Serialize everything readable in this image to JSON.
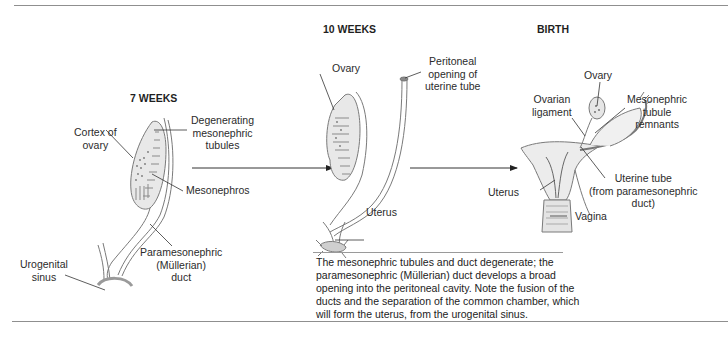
{
  "stages": [
    {
      "id": "7-weeks",
      "title": "7 WEEKS"
    },
    {
      "id": "10-weeks",
      "title": "10 WEEKS"
    },
    {
      "id": "birth",
      "title": "BIRTH"
    }
  ],
  "labels": {
    "week7": {
      "cortex_of_ovary": "Cortex of\novary",
      "degenerating_tubules": "Degenerating\nmesonephric\ntubules",
      "mesonephros": "Mesonephros",
      "paramesonephric_duct": "Paramesonephric\n(Müllerian)\nduct",
      "urogenital_sinus": "Urogenital\nsinus"
    },
    "week10": {
      "ovary": "Ovary",
      "peritoneal_opening": "Peritoneal\nopening of\nuterine tube",
      "uterus": "Uterus"
    },
    "birth": {
      "ovary": "Ovary",
      "ovarian_ligament": "Ovarian\nligament",
      "mesonephric_remnants": "Mesonephric\ntubule\nremnants",
      "uterine_tube": "Uterine tube\n(from paramesonephric\nduct)",
      "uterus": "Uterus",
      "vagina": "Vagina"
    }
  },
  "caption": "The mesonephric tubules and duct degenerate; the paramesonephric (Müllerian) duct develops a broad opening into the peritoneal cavity. Note the fusion of the ducts and the separation of the common chamber, which will form the uterus, from the urogenital sinus.",
  "colors": {
    "rule": "#8f8f8f",
    "outline": "#7a7a7a",
    "tissue": "#e6e6e6",
    "text": "#2b2b2b"
  }
}
